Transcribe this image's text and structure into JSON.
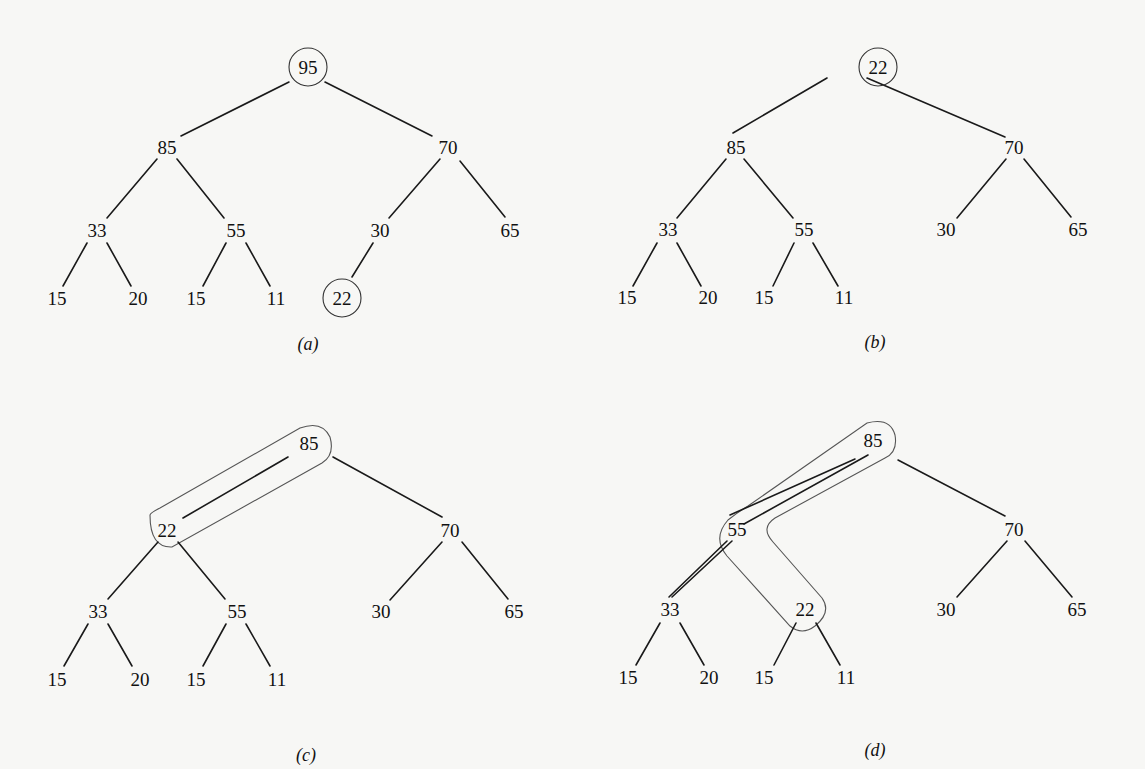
{
  "figures": [
    {
      "id": "a",
      "caption": "(a)",
      "caption_pos": [
        308,
        350
      ],
      "nodes": [
        {
          "id": "n1",
          "value": "95",
          "x": 308,
          "y": 67,
          "circled": true
        },
        {
          "id": "n2",
          "value": "85",
          "x": 167,
          "y": 147
        },
        {
          "id": "n3",
          "value": "70",
          "x": 448,
          "y": 147
        },
        {
          "id": "n4",
          "value": "33",
          "x": 97,
          "y": 230
        },
        {
          "id": "n5",
          "value": "55",
          "x": 236,
          "y": 230
        },
        {
          "id": "n6",
          "value": "30",
          "x": 380,
          "y": 230
        },
        {
          "id": "n7",
          "value": "65",
          "x": 510,
          "y": 230
        },
        {
          "id": "n8",
          "value": "15",
          "x": 57,
          "y": 298
        },
        {
          "id": "n9",
          "value": "20",
          "x": 138,
          "y": 298
        },
        {
          "id": "n10",
          "value": "15",
          "x": 196,
          "y": 298
        },
        {
          "id": "n11",
          "value": "11",
          "x": 276,
          "y": 298
        },
        {
          "id": "n12",
          "value": "22",
          "x": 342,
          "y": 298,
          "circled": true
        }
      ],
      "edges": [
        [
          289,
          82,
          181,
          136
        ],
        [
          325,
          82,
          432,
          136
        ],
        [
          157,
          159,
          107,
          218
        ],
        [
          177,
          159,
          224,
          218
        ],
        [
          440,
          159,
          389,
          218
        ],
        [
          460,
          161,
          505,
          217
        ],
        [
          87,
          243,
          63,
          286
        ],
        [
          107,
          243,
          131,
          286
        ],
        [
          226,
          243,
          203,
          286
        ],
        [
          246,
          243,
          270,
          286
        ],
        [
          373,
          243,
          352,
          277
        ]
      ]
    },
    {
      "id": "b",
      "caption": "(b)",
      "caption_pos": [
        875,
        348
      ],
      "nodes": [
        {
          "id": "n1",
          "value": "22",
          "x": 878,
          "y": 67,
          "circled": true
        },
        {
          "id": "n2",
          "value": "85",
          "x": 736,
          "y": 147
        },
        {
          "id": "n3",
          "value": "70",
          "x": 1014,
          "y": 147
        },
        {
          "id": "n4",
          "value": "33",
          "x": 668,
          "y": 229
        },
        {
          "id": "n5",
          "value": "55",
          "x": 804,
          "y": 229
        },
        {
          "id": "n6",
          "value": "30",
          "x": 946,
          "y": 229
        },
        {
          "id": "n7",
          "value": "65",
          "x": 1078,
          "y": 229
        },
        {
          "id": "n8",
          "value": "15",
          "x": 627,
          "y": 297
        },
        {
          "id": "n9",
          "value": "20",
          "x": 708,
          "y": 297
        },
        {
          "id": "n10",
          "value": "15",
          "x": 764,
          "y": 297
        },
        {
          "id": "n11",
          "value": "11",
          "x": 844,
          "y": 297
        }
      ],
      "edges": [
        [
          827,
          78,
          733,
          133
        ],
        [
          867,
          78,
          1005,
          137
        ],
        [
          726,
          159,
          677,
          218
        ],
        [
          744,
          159,
          793,
          218
        ],
        [
          1006,
          159,
          957,
          218
        ],
        [
          1024,
          159,
          1071,
          217
        ],
        [
          657,
          243,
          633,
          286
        ],
        [
          677,
          243,
          701,
          286
        ],
        [
          794,
          243,
          773,
          286
        ],
        [
          813,
          243,
          838,
          286
        ]
      ]
    },
    {
      "id": "c",
      "caption": "(c)",
      "caption_pos": [
        306,
        761
      ],
      "nodes": [
        {
          "id": "n1",
          "value": "85",
          "x": 309,
          "y": 443
        },
        {
          "id": "n2",
          "value": "22",
          "x": 167,
          "y": 530
        },
        {
          "id": "n3",
          "value": "70",
          "x": 450,
          "y": 530
        },
        {
          "id": "n4",
          "value": "33",
          "x": 98,
          "y": 611
        },
        {
          "id": "n5",
          "value": "55",
          "x": 237,
          "y": 611
        },
        {
          "id": "n6",
          "value": "30",
          "x": 381,
          "y": 611
        },
        {
          "id": "n7",
          "value": "65",
          "x": 514,
          "y": 611
        },
        {
          "id": "n8",
          "value": "15",
          "x": 57,
          "y": 679
        },
        {
          "id": "n9",
          "value": "20",
          "x": 140,
          "y": 679
        },
        {
          "id": "n10",
          "value": "15",
          "x": 196,
          "y": 679
        },
        {
          "id": "n11",
          "value": "11",
          "x": 277,
          "y": 679
        }
      ],
      "edges": [
        [
          288,
          457,
          183,
          518
        ],
        [
          333,
          457,
          442,
          517
        ],
        [
          158,
          542,
          108,
          599
        ],
        [
          178,
          542,
          225,
          599
        ],
        [
          442,
          542,
          390,
          600
        ],
        [
          462,
          542,
          508,
          599
        ],
        [
          88,
          624,
          64,
          666
        ],
        [
          108,
          624,
          132,
          666
        ],
        [
          226,
          624,
          203,
          666
        ],
        [
          246,
          624,
          270,
          666
        ]
      ],
      "highlight": {
        "label": "swap-path",
        "path": "M 150 515 Q 150 548 172 547 L 322 463 Q 335 455 330 437 Q 322 420 300 428 L 160 508 Q 150 513 150 515 Z"
      }
    },
    {
      "id": "d",
      "caption": "(d)",
      "caption_pos": [
        875,
        756
      ],
      "nodes": [
        {
          "id": "n1",
          "value": "85",
          "x": 873,
          "y": 440
        },
        {
          "id": "n2",
          "value": "55",
          "x": 737,
          "y": 529
        },
        {
          "id": "n3",
          "value": "70",
          "x": 1014,
          "y": 529
        },
        {
          "id": "n4",
          "value": "33",
          "x": 670,
          "y": 609
        },
        {
          "id": "n5",
          "value": "22",
          "x": 805,
          "y": 609
        },
        {
          "id": "n6",
          "value": "30",
          "x": 946,
          "y": 609
        },
        {
          "id": "n7",
          "value": "65",
          "x": 1077,
          "y": 609
        },
        {
          "id": "n8",
          "value": "15",
          "x": 628,
          "y": 677
        },
        {
          "id": "n9",
          "value": "20",
          "x": 709,
          "y": 677
        },
        {
          "id": "n10",
          "value": "15",
          "x": 764,
          "y": 677
        },
        {
          "id": "n11",
          "value": "11",
          "x": 846,
          "y": 677
        }
      ],
      "edges": [
        [
          855,
          459,
          730,
          515
        ],
        [
          868,
          455,
          744,
          524
        ],
        [
          898,
          460,
          1005,
          516
        ],
        [
          727,
          541,
          669,
          597
        ],
        [
          732,
          541,
          672,
          597
        ],
        [
          1007,
          541,
          957,
          597
        ],
        [
          1025,
          541,
          1072,
          597
        ],
        [
          660,
          623,
          636,
          665
        ],
        [
          680,
          623,
          704,
          665
        ],
        [
          796,
          623,
          774,
          665
        ],
        [
          816,
          623,
          840,
          665
        ]
      ],
      "highlight": {
        "label": "swap-path",
        "path": "M 867 423 Q 890 417 895 435 Q 898 452 885 458 L 775 518 Q 760 528 773 542 L 822 598 Q 832 612 815 626 Q 802 636 790 626 L 727 556 Q 712 538 728 520 Q 738 512 748 506 Z"
      }
    }
  ]
}
